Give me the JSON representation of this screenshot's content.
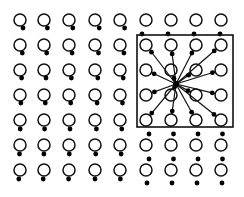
{
  "diagram": {
    "colors": {
      "background": "#ffffff",
      "stroke": "#111111",
      "dot": "#000000"
    },
    "grid": {
      "columns_x": [
        20,
        44,
        69,
        95,
        120,
        146,
        171,
        196,
        221
      ],
      "rows_y": [
        20,
        45,
        70,
        95,
        120,
        145,
        170
      ],
      "circle_radius": 6
    },
    "box": {
      "x": 137,
      "y": 35,
      "width": 96,
      "height": 92
    },
    "center_point": {
      "x": 176,
      "y": 84
    }
  }
}
